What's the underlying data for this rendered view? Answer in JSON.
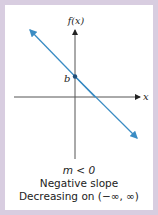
{
  "graph": {
    "y_axis_label": "f(x)",
    "x_axis_label": "x",
    "intercept_label": "b",
    "line_color": "#3a8cc4",
    "frame_color": "#d8cde0"
  },
  "caption": {
    "condition": "m < 0",
    "slope_description": "Negative slope",
    "interval_description": "Decreasing on (−∞, ∞)"
  }
}
